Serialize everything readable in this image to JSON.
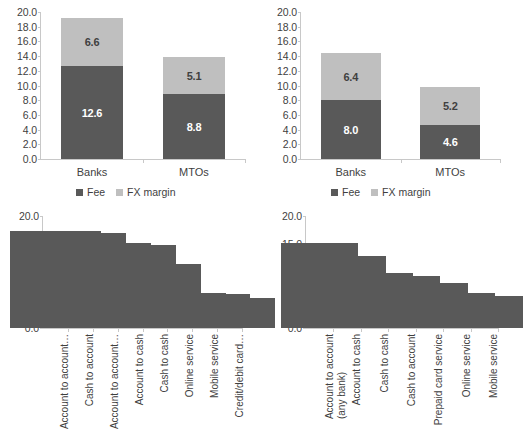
{
  "legend": {
    "entries": [
      {
        "label": "Fee",
        "color": "#595959",
        "key": "fee"
      },
      {
        "label": "FX margin",
        "color": "#bfbfbf",
        "key": "fx"
      }
    ]
  },
  "colors": {
    "fee": "#595959",
    "fx_margin": "#bfbfbf",
    "axis": "#c8c8c8",
    "text": "#3f3f3f",
    "background": "#ffffff"
  },
  "chart_data": [
    {
      "id": "top-left",
      "type": "bar",
      "stacked": true,
      "title": "",
      "xlabel": "",
      "ylabel": "",
      "categories": [
        "Banks",
        "MTOs"
      ],
      "series": [
        {
          "name": "Fee",
          "values": [
            12.6,
            8.8
          ],
          "color": "#595959"
        },
        {
          "name": "FX margin",
          "values": [
            6.6,
            5.1
          ],
          "color": "#bfbfbf"
        }
      ],
      "totals": [
        19.2,
        13.9
      ],
      "data_labels": [
        [
          "12.6",
          "6.6"
        ],
        [
          "8.8",
          "5.1"
        ]
      ],
      "ylim": [
        0.0,
        20.0
      ],
      "ytick_step": 2.0,
      "yticks": [
        "0.0",
        "2.0",
        "4.0",
        "6.0",
        "8.0",
        "10.0",
        "12.0",
        "14.0",
        "16.0",
        "18.0",
        "20.0"
      ],
      "grid": false,
      "legend_position": "bottom"
    },
    {
      "id": "top-right",
      "type": "bar",
      "stacked": true,
      "title": "",
      "xlabel": "",
      "ylabel": "",
      "categories": [
        "Banks",
        "MTOs"
      ],
      "series": [
        {
          "name": "Fee",
          "values": [
            8.0,
            4.6
          ],
          "color": "#595959"
        },
        {
          "name": "FX margin",
          "values": [
            6.4,
            5.2
          ],
          "color": "#bfbfbf"
        }
      ],
      "totals": [
        14.4,
        9.8
      ],
      "data_labels": [
        [
          "8.0",
          "6.4"
        ],
        [
          "4.6",
          "5.2"
        ]
      ],
      "ylim": [
        0.0,
        20.0
      ],
      "ytick_step": 2.0,
      "yticks": [
        "0.0",
        "2.0",
        "4.0",
        "6.0",
        "8.0",
        "10.0",
        "12.0",
        "14.0",
        "16.0",
        "18.0",
        "20.0"
      ],
      "grid": false,
      "legend_position": "bottom"
    },
    {
      "id": "bottom-left",
      "type": "bar",
      "stacked": false,
      "title": "",
      "xlabel": "",
      "ylabel": "",
      "categories": [
        "Account to account…",
        "Cash to account",
        "Account to account…",
        "Account to cash",
        "Cash to cash",
        "Online service",
        "Mobile service",
        "Credit/debit card…"
      ],
      "series": [
        {
          "name": "Fee",
          "values": [
            17.3,
            16.9,
            15.2,
            14.9,
            11.5,
            6.2,
            6.0,
            5.4
          ],
          "color": "#595959"
        }
      ],
      "ylim": [
        0.0,
        20.0
      ],
      "ytick_step": 5.0,
      "yticks": [
        "0.0",
        "5.0",
        "10.0",
        "15.0",
        "20.0"
      ],
      "grid": false,
      "legend_position": "top"
    },
    {
      "id": "bottom-right",
      "type": "bar",
      "stacked": false,
      "title": "",
      "xlabel": "",
      "ylabel": "",
      "categories": [
        "Account to account",
        "Account to cash",
        "Cash to cash",
        "Cash to account",
        "Prepaid card service",
        "Online service",
        "Mobile service"
      ],
      "categories_line2": [
        "(any bank)",
        "",
        "",
        "",
        "",
        "",
        ""
      ],
      "series": [
        {
          "name": "Fee",
          "values": [
            15.2,
            12.8,
            9.9,
            9.3,
            8.0,
            6.3,
            5.8
          ],
          "color": "#595959"
        }
      ],
      "ylim": [
        0.0,
        20.0
      ],
      "ytick_step": 5.0,
      "yticks": [
        "0.0",
        "5.0",
        "10.0",
        "15.0",
        "20.0"
      ],
      "grid": false,
      "legend_position": "top"
    }
  ]
}
